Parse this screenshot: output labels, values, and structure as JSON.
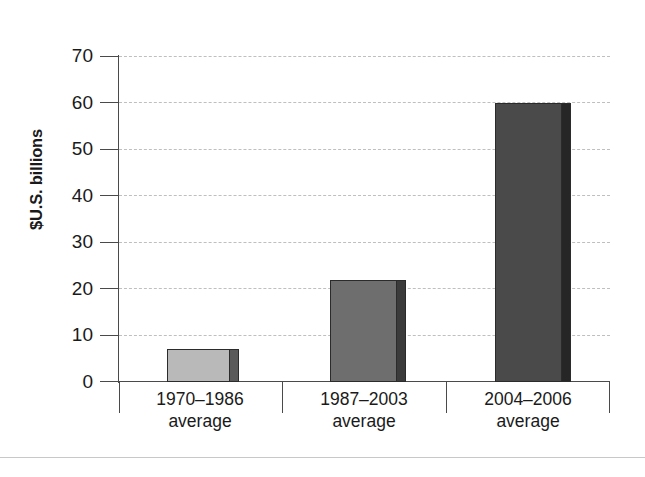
{
  "chart_data": {
    "type": "bar",
    "title": "",
    "xlabel": "",
    "ylabel": "$U.S. billions",
    "ylim": [
      0,
      70
    ],
    "yticks": [
      0,
      10,
      20,
      30,
      40,
      50,
      60,
      70
    ],
    "ytick_labels": [
      "0",
      "10",
      "20",
      "30",
      "40",
      "50",
      "60",
      "70"
    ],
    "grid": true,
    "legend": "none",
    "categories": [
      "1970–1986 average",
      "1987–2003 average",
      "2004–2006 average"
    ],
    "category_lines": [
      {
        "range": "1970–1986",
        "sub": "average"
      },
      {
        "range": "1987–2003",
        "sub": "average"
      },
      {
        "range": "2004–2006",
        "sub": "average"
      }
    ],
    "values": [
      7,
      22,
      60
    ],
    "bar_colors": [
      "#b9b9b9",
      "#6e6e6e",
      "#4a4a4a"
    ],
    "bar_side_colors": [
      "#5a5a5a",
      "#3b3b3b",
      "#262626"
    ],
    "gridline_color": "#bfbfbf",
    "axis_color": "#4a4a4a",
    "background_color": "#ffffff"
  }
}
